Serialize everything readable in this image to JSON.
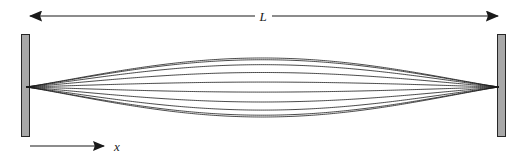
{
  "figure": {
    "background_color": "#ffffff",
    "width": 530,
    "height": 158,
    "labels": {
      "length_label": "L",
      "axis_label": "x"
    },
    "colors": {
      "curve_stroke": "#1a1a1a",
      "wall_fill": "#a8a8a8",
      "wall_stroke": "#262626",
      "arrow_stroke": "#1a1a1a",
      "text": "#1a1a1a"
    },
    "walls": {
      "left": {
        "x": 21,
        "y": 34,
        "width": 9,
        "height": 103
      },
      "right": {
        "x": 497,
        "y": 34,
        "width": 9,
        "height": 103
      }
    },
    "dimension_arrow": {
      "name": "length-dimension-arrow",
      "y": 16,
      "x_start": 28,
      "x_end": 500,
      "double_headed": true,
      "label": "L",
      "label_x": 262,
      "label_y": 21
    },
    "axis_arrow": {
      "name": "x-axis-arrow",
      "y": 146,
      "x_start": 30,
      "x_end": 106,
      "double_headed": false,
      "label": "x",
      "label_x": 117,
      "label_y": 151
    },
    "wave": {
      "node_left_x": 26,
      "node_right_x": 499,
      "axis_y": 87,
      "description": "family of sinusoidal half-wave profiles (single antinode) at successive phases",
      "curve_count": 18,
      "max_amplitude_up": 29,
      "max_amplitude_down": 30
    }
  },
  "chart_data": {
    "type": "line",
    "title": "",
    "xlabel": "x",
    "ylabel": "",
    "xlim": [
      0,
      1
    ],
    "ylim": [
      -1,
      1
    ],
    "grid": false,
    "legend": false,
    "x_axis_length_label": "L",
    "series": [
      {
        "name": "phase-1",
        "amplitude": 1.0,
        "mode": 1
      },
      {
        "name": "phase-2",
        "amplitude": 0.94,
        "mode": 1
      },
      {
        "name": "phase-3",
        "amplitude": 0.77,
        "mode": 1
      },
      {
        "name": "phase-4",
        "amplitude": 0.5,
        "mode": 1
      },
      {
        "name": "phase-5",
        "amplitude": 0.17,
        "mode": 1
      },
      {
        "name": "phase-6",
        "amplitude": -0.17,
        "mode": 1
      },
      {
        "name": "phase-7",
        "amplitude": -0.5,
        "mode": 1
      },
      {
        "name": "phase-8",
        "amplitude": -0.77,
        "mode": 1
      },
      {
        "name": "phase-9",
        "amplitude": -0.94,
        "mode": 1
      },
      {
        "name": "phase-10",
        "amplitude": -1.0,
        "mode": 1
      }
    ]
  }
}
